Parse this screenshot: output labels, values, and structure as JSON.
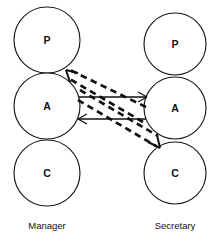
{
  "diagram": {
    "type": "transactional-analysis-crossed-transaction",
    "columns": [
      {
        "id": "manager",
        "label": "Manager",
        "label_x": 47,
        "label_y": 228,
        "center_x": 47,
        "ego_states": [
          {
            "code": "P",
            "name": "Parent",
            "cx": 47,
            "cy": 40,
            "r": 33
          },
          {
            "code": "A",
            "name": "Adult",
            "cx": 47,
            "cy": 106,
            "r": 33
          },
          {
            "code": "C",
            "name": "Child",
            "cx": 47,
            "cy": 173,
            "r": 33
          }
        ]
      },
      {
        "id": "secretary",
        "label": "Secretary",
        "label_x": 175,
        "label_y": 228,
        "center_x": 175,
        "ego_states": [
          {
            "code": "P",
            "name": "Parent",
            "cx": 175,
            "cy": 44,
            "r": 31
          },
          {
            "code": "A",
            "name": "Adult",
            "cx": 175,
            "cy": 108,
            "r": 31
          },
          {
            "code": "C",
            "name": "Child",
            "cx": 175,
            "cy": 173,
            "r": 31
          }
        ]
      }
    ],
    "transactions": [
      {
        "id": "manager-adult-to-secretary-adult",
        "style": "solid",
        "from": "manager.A",
        "to": "secretary.A",
        "direction": "right",
        "x1": 79,
        "y1": 97,
        "x2": 146,
        "y2": 97
      },
      {
        "id": "secretary-adult-to-manager-adult",
        "style": "solid",
        "from": "secretary.A",
        "to": "manager.A",
        "direction": "left",
        "x1": 146,
        "y1": 119,
        "x2": 79,
        "y2": 119
      },
      {
        "id": "secretary-adult-to-manager-parent-upper",
        "style": "dashed",
        "from": "secretary.A",
        "to": "manager.P",
        "direction": "up-left",
        "x1": 145,
        "y1": 108,
        "x2": 68,
        "y2": 70
      },
      {
        "id": "secretary-adult-to-manager-parent-lower",
        "style": "dashed",
        "from": "secretary.A",
        "to": "manager.P",
        "direction": "up-left",
        "x1": 143,
        "y1": 122,
        "x2": 68,
        "y2": 78
      },
      {
        "id": "manager-adult-to-secretary-child-upper",
        "style": "dashed",
        "from": "manager.A",
        "to": "secretary.C",
        "direction": "down-right",
        "x1": 80,
        "y1": 91,
        "x2": 157,
        "y2": 137
      },
      {
        "id": "manager-adult-to-secretary-child-lower",
        "style": "dashed",
        "from": "manager.A",
        "to": "secretary.C",
        "direction": "down-right",
        "x1": 78,
        "y1": 100,
        "x2": 155,
        "y2": 146
      }
    ]
  },
  "colors": {
    "background": "#ffffff",
    "stroke": "#111111",
    "circle_fill": "#ffffff"
  }
}
